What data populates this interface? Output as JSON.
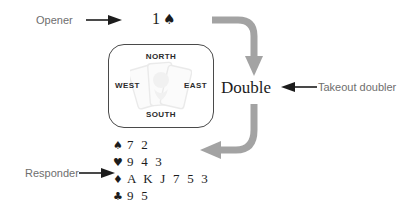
{
  "diagram": {
    "accent_gray": "#a3a3a3",
    "label_gray": "#6e6e6e",
    "ink": "#1c1c1c"
  },
  "callouts": {
    "opener": "Opener",
    "responder": "Responder",
    "takeout_doubler": "Takeout doubler"
  },
  "bids": {
    "opening_bid_level": "1",
    "opening_bid_suit": "♠",
    "double": "Double"
  },
  "compass": {
    "north": "NORTH",
    "south": "SOUTH",
    "east": "EAST",
    "west": "WEST"
  },
  "responder_hand": [
    {
      "suit": "♠",
      "suit_name": "spades",
      "cards": "7 2"
    },
    {
      "suit": "♥",
      "suit_name": "hearts",
      "cards": "9 4 3"
    },
    {
      "suit": "♦",
      "suit_name": "diamonds",
      "cards": "A K J 7 5 3"
    },
    {
      "suit": "♣",
      "suit_name": "clubs",
      "cards": "9 5"
    }
  ]
}
